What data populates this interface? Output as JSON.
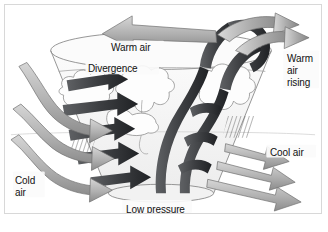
{
  "figure": {
    "kind": "meteorological-diagram",
    "background_color": "#ffffff",
    "border_color": "#d8d8d8"
  },
  "labels": {
    "warm_air": "Warm air",
    "divergence": "Divergence",
    "warm_air_rising": "Warm\nair\nrising",
    "cool_air": "Cool air",
    "cold_air": "Cold\nair",
    "low_pressure": "Low pressure"
  },
  "colors": {
    "arrow_gray_light": "#cfcfcf",
    "arrow_gray_mid": "#9a9a9a",
    "arrow_gray_dark": "#6f6f6f",
    "arrow_black": "#16181a",
    "cloud_white": "#fdfdfd",
    "cloud_outline": "#8d8d8d",
    "funnel_fill": "#f4f4f4",
    "funnel_outline": "#8a8a8a",
    "rain_hatch": "#4a4a4a",
    "text": "#111111"
  },
  "elements": {
    "funnel": "inverted cone vortex, wide ellipse top, narrow ellipse base",
    "vortex_bands": "black spiral arrow bands converging inward and rising",
    "clouds": "cumulonimbus cloud masses inside and around the vortex",
    "rain": "diagonal hatch precipitation under clouds, left and right",
    "inflow_arrows": "three gray S-curved surface arrows entering from the left",
    "outflow_arrows": "three gray arrows leaving to the lower right",
    "top_outflow_arrow": "large gray arrow pointing left at the top",
    "rising_arrows": "dark curved arrows rising out of the vortex top to the right"
  }
}
